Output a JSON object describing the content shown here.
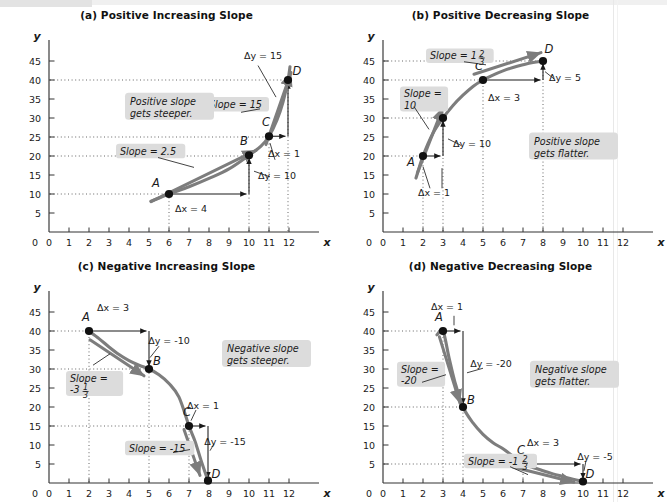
{
  "figure": {
    "background": "#ffffff",
    "curve_color": "#7d7d7d",
    "accent_dark": "#1a1a1a",
    "label_bg": "#dcdcdc"
  },
  "axis": {
    "x_name": "x",
    "y_name": "y",
    "x_ticks": [
      "0",
      "1",
      "2",
      "3",
      "4",
      "5",
      "6",
      "7",
      "8",
      "9",
      "10",
      "11",
      "12"
    ],
    "y_ticks": [
      "5",
      "10",
      "15",
      "20",
      "25",
      "30",
      "35",
      "40",
      "45"
    ],
    "x_min": 0,
    "x_max": 12.6,
    "y_min": 0,
    "y_max": 48
  },
  "panels": [
    {
      "id": "panel-a",
      "title": "(a) Positive Increasing Slope",
      "callout": "Positive slope\ngets steeper.",
      "callout_line1": "Positive slope",
      "callout_line2": "gets steeper.",
      "callout_x": 4.05,
      "callout_y": 33.5,
      "chart_data": {
        "type": "line",
        "title": "(a) Positive Increasing Slope",
        "xlabel": "x",
        "ylabel": "y",
        "xlim": [
          0,
          12.6
        ],
        "ylim": [
          0,
          48
        ],
        "grid": false,
        "curve_kind": "convex-increasing",
        "curve_points": [
          [
            5.1,
            8.1
          ],
          [
            6,
            10
          ],
          [
            7,
            11.9
          ],
          [
            8,
            14.1
          ],
          [
            9,
            16.6
          ],
          [
            10,
            20.2
          ],
          [
            10.6,
            22.6
          ],
          [
            11,
            25.2
          ],
          [
            11.4,
            29.5
          ],
          [
            11.7,
            34.2
          ],
          [
            11.95,
            40
          ],
          [
            12.05,
            43.5
          ]
        ],
        "points": [
          {
            "label": "A",
            "x": 6,
            "y": 10,
            "lx": -13,
            "ly": -7
          },
          {
            "label": "B",
            "x": 10,
            "y": 20.2,
            "lx": -5,
            "ly": -10
          },
          {
            "label": "C",
            "x": 11,
            "y": 25.2,
            "lx": -3,
            "ly": -10
          },
          {
            "label": "D",
            "x": 11.95,
            "y": 40,
            "lx": 9,
            "ly": -5
          }
        ],
        "slope_labels": [
          {
            "text": "Slope = 2.5",
            "x": 3.55,
            "y": 20.3
          },
          {
            "text": "Slope = 15",
            "x": 8.0,
            "y": 32.6
          }
        ],
        "deltas": [
          {
            "text": "Δx = 4",
            "x": 7.1,
            "y": 5.3
          },
          {
            "text": "Δy = 10",
            "x": 11.4,
            "y": 13.9
          },
          {
            "text": "Δx = 1",
            "x": 11.75,
            "y": 19.7
          },
          {
            "text": "Δy = 15",
            "x": 10.7,
            "y": 45.6
          }
        ],
        "hlines": [
          10,
          20,
          25,
          40
        ],
        "vlines": [
          {
            "x": 6,
            "y": 10
          },
          {
            "x": 10,
            "y": 20.2
          },
          {
            "x": 11,
            "y": 25.2
          },
          {
            "x": 11.95,
            "y": 40
          }
        ],
        "rise_run": [
          {
            "x1": 6,
            "y1": 10,
            "x2": 10,
            "y2": 10,
            "x3": 10,
            "y3": 20.2
          },
          {
            "x1": 11,
            "y1": 25.2,
            "x2": 11.95,
            "y2": 25.2,
            "x3": 11.95,
            "y3": 40
          }
        ],
        "tangents": [
          {
            "x1": 5.1,
            "y1": 8.0,
            "x2": 10.35,
            "y2": 21.5
          },
          {
            "x1": 10.85,
            "y1": 23.0,
            "x2": 12.1,
            "y2": 42.0
          }
        ]
      }
    },
    {
      "id": "panel-b",
      "title": "(b) Positive Decreasing Slope",
      "callout_line1": "Positive slope",
      "callout_line2": "gets flatter.",
      "callout_x": 7.55,
      "callout_y": 23.0,
      "chart_data": {
        "type": "line",
        "title": "(b) Positive Decreasing Slope",
        "xlabel": "x",
        "ylabel": "y",
        "xlim": [
          0,
          12.6
        ],
        "ylim": [
          0,
          48
        ],
        "grid": false,
        "curve_kind": "concave-increasing",
        "curve_points": [
          [
            1.65,
            14.2
          ],
          [
            2,
            20
          ],
          [
            2.5,
            26.0
          ],
          [
            3,
            30
          ],
          [
            3.5,
            33.3
          ],
          [
            4,
            36.0
          ],
          [
            4.5,
            38.3
          ],
          [
            5,
            40
          ],
          [
            5.5,
            41.3
          ],
          [
            6,
            42.4
          ],
          [
            6.5,
            43.3
          ],
          [
            7,
            44.0
          ],
          [
            7.5,
            44.6
          ],
          [
            8,
            45
          ]
        ],
        "points": [
          {
            "label": "A",
            "x": 2,
            "y": 20,
            "lx": -12,
            "ly": 10
          },
          {
            "label": "B",
            "x": 3,
            "y": 30,
            "lx": -4,
            "ly": -10
          },
          {
            "label": "C",
            "x": 5,
            "y": 40,
            "lx": -4,
            "ly": -10
          },
          {
            "label": "D",
            "x": 8,
            "y": 45,
            "lx": 6,
            "ly": -8
          }
        ],
        "slope_labels": [
          {
            "text": "Slope =",
            "x": 1.05,
            "y": 35.4,
            "line2": "10"
          },
          {
            "text": "Slope = 1",
            "x": 2.35,
            "y": 45.4,
            "frac_num": "2",
            "frac_den": "3"
          }
        ],
        "deltas": [
          {
            "text": "Δx = 1",
            "x": 2.55,
            "y": 9.6
          },
          {
            "text": "Δy = 10",
            "x": 4.45,
            "y": 22.5
          },
          {
            "text": "Δx = 3",
            "x": 6.05,
            "y": 34.5
          },
          {
            "text": "Δy = 5",
            "x": 9.1,
            "y": 39.8
          }
        ],
        "hlines": [
          20,
          30,
          40,
          45
        ],
        "vlines": [
          {
            "x": 2,
            "y": 20
          },
          {
            "x": 3,
            "y": 30
          },
          {
            "x": 5,
            "y": 40
          },
          {
            "x": 8,
            "y": 45
          }
        ],
        "rise_run": [
          {
            "x1": 2,
            "y1": 20,
            "x2": 3,
            "y2": 20,
            "x3": 3,
            "y3": 30
          },
          {
            "x1": 5,
            "y1": 40,
            "x2": 8,
            "y2": 40,
            "x3": 8,
            "y3": 45
          }
        ],
        "tangents": [
          {
            "x1": 1.72,
            "y1": 15.5,
            "x2": 3.0,
            "y2": 32.8
          },
          {
            "x1": 4.55,
            "y1": 41.5,
            "x2": 7.9,
            "y2": 47.2
          }
        ]
      }
    },
    {
      "id": "panel-c",
      "title": "(c) Negative Increasing Slope",
      "callout_line1": "Negative slope",
      "callout_line2": "gets steeper.",
      "callout_x": 8.9,
      "callout_y": 34.5,
      "chart_data": {
        "type": "line",
        "title": "(c) Negative Increasing Slope",
        "xlabel": "x",
        "ylabel": "y",
        "xlim": [
          0,
          12.6
        ],
        "ylim": [
          0,
          48
        ],
        "grid": false,
        "curve_kind": "concave-decreasing",
        "curve_points": [
          [
            2,
            40
          ],
          [
            2.5,
            38.0
          ],
          [
            3,
            35.8
          ],
          [
            3.5,
            33.8
          ],
          [
            4,
            32.2
          ],
          [
            4.5,
            31.0
          ],
          [
            5,
            30
          ],
          [
            5.5,
            28.5
          ],
          [
            6,
            26.2
          ],
          [
            6.5,
            22.6
          ],
          [
            7,
            15
          ],
          [
            7.3,
            11.0
          ],
          [
            7.6,
            6.0
          ],
          [
            7.95,
            0.6
          ]
        ],
        "points": [
          {
            "label": "A",
            "x": 2,
            "y": 40,
            "lx": -3,
            "ly": -10
          },
          {
            "label": "B",
            "x": 5,
            "y": 30,
            "lx": 8,
            "ly": -4
          },
          {
            "label": "C",
            "x": 7,
            "y": 15,
            "lx": -2,
            "ly": -10
          },
          {
            "label": "D",
            "x": 7.95,
            "y": 0.6,
            "lx": 8,
            "ly": -3
          }
        ],
        "slope_labels": [
          {
            "text": "Slope =",
            "x": 1.05,
            "y": 26.6,
            "line2": "-3",
            "frac_num": "1",
            "frac_den": "3"
          },
          {
            "text": "Slope = -15",
            "x": 4.0,
            "y": 8.2
          }
        ],
        "deltas": [
          {
            "text": "Δx = 3",
            "x": 3.2,
            "y": 45.3
          },
          {
            "text": "Δy = -10",
            "x": 6.0,
            "y": 36.6
          },
          {
            "text": "Δx = 1",
            "x": 7.7,
            "y": 19.6
          },
          {
            "text": "Δy = -15",
            "x": 8.8,
            "y": 10.0
          }
        ],
        "hlines": [
          40,
          30,
          15
        ],
        "vlines": [
          {
            "x": 2,
            "y": 40
          },
          {
            "x": 5,
            "y": 30
          },
          {
            "x": 7,
            "y": 15
          }
        ],
        "rise_run": [
          {
            "x1": 2,
            "y1": 40,
            "x2": 5,
            "y2": 40,
            "x3": 5,
            "y3": 30
          },
          {
            "x1": 7,
            "y1": 15,
            "x2": 7.95,
            "y2": 15,
            "x3": 7.95,
            "y3": 0.6
          }
        ],
        "tangents": [
          {
            "x1": 2.05,
            "y1": 37.7,
            "x2": 4.75,
            "y2": 28.2
          },
          {
            "x1": 6.75,
            "y1": 14.1,
            "x2": 7.55,
            "y2": 2.0
          }
        ]
      }
    },
    {
      "id": "panel-d",
      "title": "(d) Negative Decreasing Slope",
      "callout_line1": "Negative slope",
      "callout_line2": "gets flatter.",
      "callout_x": 7.6,
      "callout_y": 29.0,
      "chart_data": {
        "type": "line",
        "title": "(d) Negative Decreasing Slope",
        "xlabel": "x",
        "ylabel": "y",
        "xlim": [
          0,
          12.6
        ],
        "ylim": [
          0,
          48
        ],
        "grid": false,
        "curve_kind": "convex-decreasing",
        "curve_points": [
          [
            2.7,
            39.0
          ],
          [
            3,
            40
          ],
          [
            3.3,
            33.0
          ],
          [
            3.6,
            26.5
          ],
          [
            4,
            20
          ],
          [
            4.5,
            15.8
          ],
          [
            5,
            12.8
          ],
          [
            5.5,
            10.6
          ],
          [
            6,
            9.0
          ],
          [
            6.5,
            7.0
          ],
          [
            7,
            5
          ],
          [
            7.5,
            4.1
          ],
          [
            8,
            3.2
          ],
          [
            8.5,
            2.4
          ],
          [
            9,
            1.7
          ],
          [
            9.5,
            1.0
          ],
          [
            10,
            0.4
          ]
        ],
        "points": [
          {
            "label": "A",
            "x": 3,
            "y": 40,
            "lx": -4,
            "ly": -10
          },
          {
            "label": "B",
            "x": 4,
            "y": 20,
            "lx": 8,
            "ly": -3
          },
          {
            "label": "C",
            "x": 7,
            "y": 5,
            "lx": -2,
            "ly": -10
          },
          {
            "label": "D",
            "x": 10,
            "y": 0.4,
            "lx": 7,
            "ly": -3
          }
        ],
        "slope_labels": [
          {
            "text": "Slope =",
            "x": 0.9,
            "y": 29.0,
            "line2": "-20"
          },
          {
            "text": "Slope = -1",
            "x": 4.25,
            "y": 4.8,
            "frac_num": "2",
            "frac_den": "3"
          }
        ],
        "deltas": [
          {
            "text": "Δx = 1",
            "x": 3.2,
            "y": 45.5
          },
          {
            "text": "Δy = -20",
            "x": 5.4,
            "y": 30.5
          },
          {
            "text": "Δx = 3",
            "x": 8.0,
            "y": 9.8
          },
          {
            "text": "Δy = -5",
            "x": 10.6,
            "y": 6.1
          }
        ],
        "hlines": [
          40,
          20,
          5
        ],
        "vlines": [
          {
            "x": 3,
            "y": 40
          },
          {
            "x": 4,
            "y": 20
          },
          {
            "x": 7,
            "y": 5
          }
        ],
        "rise_run": [
          {
            "x1": 3,
            "y1": 40,
            "x2": 4,
            "y2": 40,
            "x3": 4,
            "y3": 20
          },
          {
            "x1": 7,
            "y1": 5,
            "x2": 10,
            "y2": 5,
            "x3": 10,
            "y3": 0.4
          }
        ],
        "tangents": [
          {
            "x1": 2.82,
            "y1": 38.5,
            "x2": 3.85,
            "y2": 21.0
          },
          {
            "x1": 6.5,
            "y1": 4.2,
            "x2": 9.55,
            "y2": 0.2
          }
        ]
      }
    }
  ]
}
